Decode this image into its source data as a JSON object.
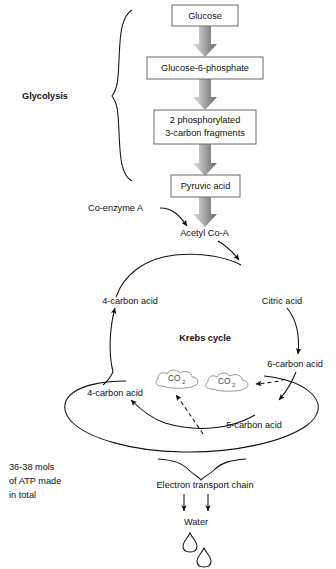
{
  "diagram": {
    "colors": {
      "text": "#111111",
      "box_border": "#6b6b6b",
      "arrow_light": "#d9d9d9",
      "arrow_dark": "#6e6e6e",
      "cloud_outline": "#8a8a8a",
      "line": "#111111",
      "background": "#ffffff"
    },
    "glycolysis": {
      "bracket_label": "Glycolysis",
      "steps": [
        {
          "id": "glucose",
          "label": "Glucose"
        },
        {
          "id": "g6p",
          "label": "Glucose-6-phosphate"
        },
        {
          "id": "fragments",
          "line1": "2 phosphorylated",
          "line2": "3-carbon fragments"
        },
        {
          "id": "pyruvic",
          "label": "Pyruvic acid"
        }
      ]
    },
    "link_stage": {
      "coenzyme_a": "Co-enzyme A",
      "acetyl_coa": "Acetyl Co-A"
    },
    "krebs": {
      "center_label": "Krebs cycle",
      "nodes": [
        {
          "id": "citric-acid",
          "label": "Citric acid"
        },
        {
          "id": "six-carbon-acid",
          "label": "6-carbon acid"
        },
        {
          "id": "five-carbon-acid",
          "label": "5-carbon acid"
        },
        {
          "id": "four-carbon-acid-lower",
          "label": "4-carbon acid"
        },
        {
          "id": "four-carbon-acid-upper",
          "label": "4-carbon acid"
        }
      ],
      "waste": [
        {
          "id": "co2-left",
          "formula": "CO",
          "subscript": "2"
        },
        {
          "id": "co2-right",
          "formula": "CO",
          "subscript": "2"
        }
      ]
    },
    "etc": {
      "label": "Electron transport chain",
      "product": "Water",
      "atp_note": {
        "line1": "36-38 mols",
        "line2": "of ATP made",
        "line3": "in total"
      }
    }
  }
}
